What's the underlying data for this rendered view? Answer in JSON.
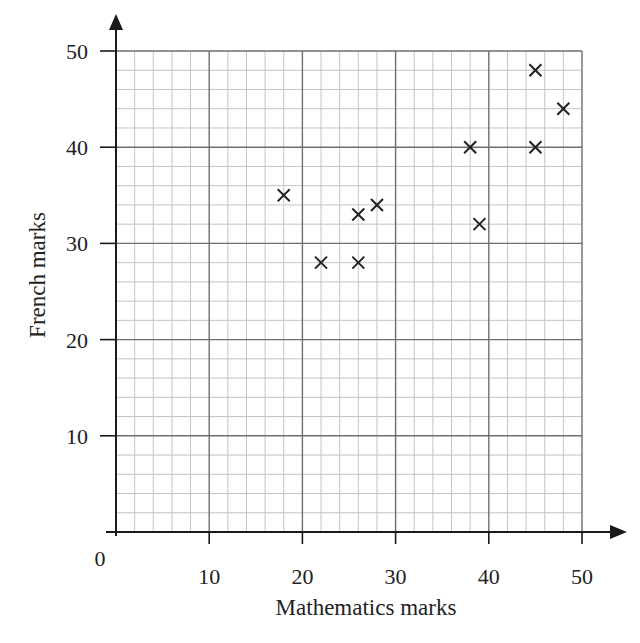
{
  "chart_data": {
    "type": "scatter",
    "title": "",
    "xlabel": "Mathematics marks",
    "ylabel": "French marks",
    "xlim": [
      0,
      50
    ],
    "ylim": [
      0,
      50
    ],
    "origin_label": "0",
    "x_ticks": [
      10,
      20,
      30,
      40,
      50
    ],
    "y_ticks": [
      10,
      20,
      30,
      40,
      50
    ],
    "grid": {
      "major_step": 10,
      "minor_step": 2,
      "on": true
    },
    "legend": null,
    "marker": "x",
    "points": [
      {
        "x": 18,
        "y": 35
      },
      {
        "x": 22,
        "y": 28
      },
      {
        "x": 26,
        "y": 33
      },
      {
        "x": 28,
        "y": 34
      },
      {
        "x": 26,
        "y": 28
      },
      {
        "x": 38,
        "y": 40
      },
      {
        "x": 39,
        "y": 32
      },
      {
        "x": 45,
        "y": 40
      },
      {
        "x": 45,
        "y": 48
      },
      {
        "x": 48,
        "y": 44
      }
    ],
    "colors": {
      "major_grid": "#6e6e6e",
      "minor_grid": "#c4c4c4",
      "axis": "#1a1a1a",
      "marker": "#222222"
    }
  }
}
